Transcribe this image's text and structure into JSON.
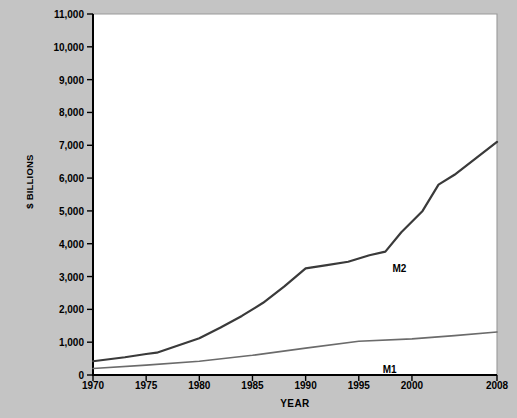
{
  "chart_data": {
    "type": "line",
    "title": "",
    "xlabel": "YEAR",
    "ylabel": "$ BILLIONS",
    "xlim": [
      1970,
      2008
    ],
    "ylim": [
      0,
      11000
    ],
    "grid": false,
    "legend_position": "inline-labels",
    "x_ticks": [
      "1970",
      "1975",
      "1980",
      "1985",
      "1990",
      "1995",
      "2000",
      "2008"
    ],
    "x_tick_values": [
      1970,
      1975,
      1980,
      1985,
      1990,
      1995,
      2000,
      2008
    ],
    "y_ticks": [
      "0",
      "1,000",
      "2,000",
      "3,000",
      "4,000",
      "5,000",
      "6,000",
      "7,000",
      "8,000",
      "9,000",
      "10,000",
      "11,000"
    ],
    "y_tick_values": [
      0,
      1000,
      2000,
      3000,
      4000,
      5000,
      6000,
      7000,
      8000,
      9000,
      10000,
      11000
    ],
    "series": [
      {
        "name": "M2",
        "label": "M2",
        "color": "#3a3a3a",
        "width": 2.2,
        "x": [
          1970,
          1973,
          1975,
          1976,
          1978,
          1980,
          1982,
          1984,
          1986,
          1988,
          1990,
          1992,
          1994,
          1996,
          1997.5,
          1999,
          2001,
          2002.5,
          2004,
          2006,
          2008
        ],
        "values": [
          420,
          540,
          640,
          680,
          900,
          1120,
          1450,
          1800,
          2200,
          2700,
          3250,
          3350,
          3450,
          3650,
          3760,
          4350,
          5000,
          5800,
          6100,
          6600,
          7100
        ]
      },
      {
        "name": "M1",
        "label": "M1",
        "color": "#6b6b6b",
        "width": 1.6,
        "x": [
          1970,
          1975,
          1980,
          1985,
          1990,
          1995,
          2000,
          2004,
          2008
        ],
        "values": [
          200,
          300,
          420,
          600,
          820,
          1030,
          1100,
          1200,
          1310
        ]
      }
    ],
    "annotations": [
      {
        "text": "M2",
        "x": 1997.6,
        "y": 3520,
        "dx": 6,
        "dy": 4
      },
      {
        "text": "M1",
        "x": 1998.0,
        "y": 830,
        "dx": -8,
        "dy": 16
      }
    ]
  },
  "axes": {
    "plot_left_px": 93,
    "plot_right_px": 497,
    "plot_top_px": 14,
    "plot_bottom_px": 375
  },
  "colors": {
    "background": "#c4c4c4",
    "plot_background": "#ffffff",
    "axis": "#000000",
    "plot_border": "#9a9a9a",
    "m2": "#3a3a3a",
    "m1": "#6b6b6b"
  }
}
